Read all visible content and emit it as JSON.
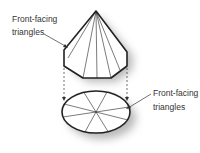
{
  "diagram": {
    "labels": {
      "top_left": {
        "line1": "Front-facing",
        "line2": "triangles"
      },
      "bottom_right": {
        "line1": "Front-facing",
        "line2": "triangles"
      }
    },
    "shapes": {
      "cone": {
        "faces": 8,
        "description": "octagonal pyramid (cone) with front-facing triangles"
      },
      "ellipse": {
        "segments": 8,
        "description": "projected base with triangle fan"
      }
    },
    "colors": {
      "stroke": "#222222",
      "fill": "#ffffff",
      "shadow": "#bbbbbb",
      "text": "#333333"
    }
  }
}
